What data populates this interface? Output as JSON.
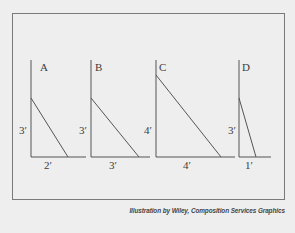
{
  "figure": {
    "frame_color": "#7a7a7a",
    "line_color": "#555555",
    "background": "#eeeeee"
  },
  "triangles": [
    {
      "id": "A",
      "label": "A",
      "height_label": "3′",
      "base_label": "2′"
    },
    {
      "id": "B",
      "label": "B",
      "height_label": "3′",
      "base_label": "3′"
    },
    {
      "id": "C",
      "label": "C",
      "height_label": "4′",
      "base_label": "4′"
    },
    {
      "id": "D",
      "label": "D",
      "height_label": "3′",
      "base_label": "1′"
    }
  ],
  "caption": "Illustration by Wiley, Composition Services Graphics"
}
